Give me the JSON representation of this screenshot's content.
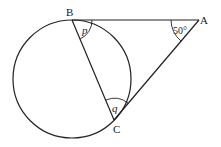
{
  "diagram": {
    "type": "circle-geometry",
    "points": {
      "A": {
        "label": "A",
        "x": 199,
        "y": 20
      },
      "B": {
        "label": "B",
        "x": 72,
        "y": 20
      },
      "C": {
        "label": "C",
        "x": 114,
        "y": 120
      }
    },
    "circle": {
      "cx": 72,
      "cy": 79,
      "r": 59
    },
    "angles": {
      "A": {
        "label": "50°"
      },
      "B": {
        "label": "p"
      },
      "C": {
        "label": "q"
      }
    },
    "colors": {
      "stroke": "#222222",
      "background": "#ffffff"
    }
  }
}
